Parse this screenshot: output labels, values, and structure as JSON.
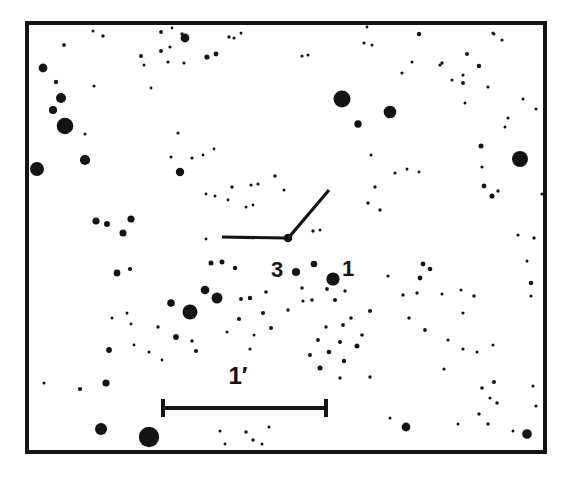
{
  "figure": {
    "kind": "astronomical-finding-chart",
    "title": "",
    "caption": "",
    "background_color": "#ffffff",
    "ink_color": "#141414",
    "frame": {
      "x": 27,
      "y": 23,
      "width": 518,
      "height": 429,
      "stroke_width": 4,
      "color": "#141414"
    }
  },
  "labels": {
    "comparison_star_3": "3",
    "comparison_star_1": "1",
    "scale_bar": "1′"
  },
  "chart_data": {
    "type": "scatter",
    "title": "",
    "subtitle": "",
    "xlabel": "",
    "ylabel": "",
    "grid": false,
    "legend": null,
    "xlim": [
      27,
      545
    ],
    "ylim": [
      23,
      452
    ],
    "axis_units": "image pixels (sky field, north/east orientation not marked)",
    "point_meaning": "Marker radius encodes stellar brightness: larger filled circle = brighter star.",
    "scale_bar": {
      "label": "1′",
      "length_arcmin": 1,
      "x_start": 163,
      "x_end": 326,
      "y": 408,
      "pixel_length": 163,
      "cap_half_height": 9,
      "line_width": 4,
      "label_x": 238,
      "label_y": 384
    },
    "target_marker": {
      "type": "two-stroke-tick",
      "target_x": 288,
      "target_y": 238,
      "strokes": [
        {
          "name": "horizontal-tick",
          "x1": 222,
          "y1": 237,
          "x2": 286,
          "y2": 238
        },
        {
          "name": "diagonal-tick",
          "x1": 290,
          "y1": 236,
          "x2": 329,
          "y2": 190
        }
      ],
      "line_width": 3.2
    },
    "annotations": [
      {
        "text": "3",
        "x": 277,
        "y": 277,
        "anchor": "middle",
        "font_size": 22,
        "bold": true,
        "refers_to_star": {
          "x": 296,
          "y": 272,
          "r": 4.0
        }
      },
      {
        "text": "1",
        "x": 348,
        "y": 276,
        "anchor": "middle",
        "font_size": 22,
        "bold": true,
        "refers_to_star": {
          "x": 333,
          "y": 279,
          "r": 6.6
        }
      },
      {
        "text": "1′",
        "x": 238,
        "y": 384,
        "anchor": "middle",
        "font_size": 24,
        "bold": true,
        "refers_to": "scale-bar"
      }
    ],
    "series": [
      {
        "name": "field stars",
        "marker": "filled-circle",
        "color": "#141414",
        "points": [
          [
            43,
            68,
            4.4
          ],
          [
            64,
            45,
            1.9
          ],
          [
            93,
            31,
            1.5
          ],
          [
            103,
            36,
            1.7
          ],
          [
            56,
            82,
            2.2
          ],
          [
            61,
            98,
            5.0
          ],
          [
            53,
            110,
            4.1
          ],
          [
            65,
            126,
            8.3
          ],
          [
            94,
            86,
            1.6
          ],
          [
            85,
            134,
            1.5
          ],
          [
            37,
            169,
            7.0
          ],
          [
            85,
            160,
            5.1
          ],
          [
            96,
            221,
            3.6
          ],
          [
            107,
            224,
            3.0
          ],
          [
            123,
            233,
            3.5
          ],
          [
            131,
            219,
            3.6
          ],
          [
            117,
            273,
            3.4
          ],
          [
            130,
            269,
            2.1
          ],
          [
            161,
            32,
            1.9
          ],
          [
            161,
            51,
            2.0
          ],
          [
            185,
            38,
            4.4
          ],
          [
            170,
            47,
            1.6
          ],
          [
            172,
            28,
            1.4
          ],
          [
            182,
            34,
            1.7
          ],
          [
            141,
            56,
            2.0
          ],
          [
            144,
            65,
            1.5
          ],
          [
            168,
            62,
            1.6
          ],
          [
            151,
            88,
            1.4
          ],
          [
            184,
            63,
            1.6
          ],
          [
            207,
            57,
            2.6
          ],
          [
            216,
            54,
            2.4
          ],
          [
            229,
            37,
            1.7
          ],
          [
            234,
            38,
            1.6
          ],
          [
            241,
            33,
            1.5
          ],
          [
            171,
            157,
            1.5
          ],
          [
            178,
            133,
            1.6
          ],
          [
            180,
            172,
            4.2
          ],
          [
            192,
            158,
            1.6
          ],
          [
            203,
            155,
            1.4
          ],
          [
            214,
            149,
            1.4
          ],
          [
            206,
            194,
            1.4
          ],
          [
            215,
            196,
            1.5
          ],
          [
            228,
            200,
            1.4
          ],
          [
            232,
            187,
            1.7
          ],
          [
            251,
            185,
            1.6
          ],
          [
            246,
            207,
            1.5
          ],
          [
            253,
            205,
            1.4
          ],
          [
            288,
            238,
            4.3
          ],
          [
            211,
            263,
            2.5
          ],
          [
            222,
            262,
            2.5
          ],
          [
            235,
            268,
            2.2
          ],
          [
            296,
            272,
            4.0
          ],
          [
            333,
            279,
            6.6
          ],
          [
            314,
            264,
            3.3
          ],
          [
            302,
            288,
            1.7
          ],
          [
            312,
            300,
            1.8
          ],
          [
            205,
            290,
            4.3
          ],
          [
            217,
            298,
            5.5
          ],
          [
            190,
            312,
            7.5
          ],
          [
            171,
            303,
            3.8
          ],
          [
            176,
            337,
            2.9
          ],
          [
            192,
            341,
            1.7
          ],
          [
            158,
            327,
            1.7
          ],
          [
            127,
            313,
            1.5
          ],
          [
            131,
            324,
            1.4
          ],
          [
            112,
            318,
            1.5
          ],
          [
            134,
            345,
            1.4
          ],
          [
            162,
            360,
            1.4
          ],
          [
            149,
            352,
            1.6
          ],
          [
            196,
            351,
            2.1
          ],
          [
            239,
            319,
            2.1
          ],
          [
            250,
            298,
            2.2
          ],
          [
            263,
            313,
            2.1
          ],
          [
            266,
            292,
            1.8
          ],
          [
            271,
            328,
            2.0
          ],
          [
            288,
            310,
            1.7
          ],
          [
            254,
            335,
            1.5
          ],
          [
            250,
            349,
            1.6
          ],
          [
            106,
            383,
            3.6
          ],
          [
            80,
            389,
            2.1
          ],
          [
            44,
            383,
            1.5
          ],
          [
            101,
            429,
            6.0
          ],
          [
            149,
            437,
            10.2
          ],
          [
            109,
            350,
            2.9
          ],
          [
            227,
            332,
            1.5
          ],
          [
            241,
            299,
            2.0
          ],
          [
            220,
            431,
            1.5
          ],
          [
            225,
            444,
            1.4
          ],
          [
            246,
            432,
            1.7
          ],
          [
            253,
            440,
            1.7
          ],
          [
            262,
            444,
            1.5
          ],
          [
            269,
            427,
            1.5
          ],
          [
            303,
            301,
            1.6
          ],
          [
            318,
            340,
            1.9
          ],
          [
            310,
            355,
            2.0
          ],
          [
            320,
            368,
            2.5
          ],
          [
            329,
            352,
            2.3
          ],
          [
            340,
            342,
            2.0
          ],
          [
            344,
            361,
            2.2
          ],
          [
            326,
            327,
            1.7
          ],
          [
            343,
            325,
            1.9
          ],
          [
            351,
            318,
            1.8
          ],
          [
            362,
            335,
            1.8
          ],
          [
            370,
            311,
            2.0
          ],
          [
            357,
            346,
            2.5
          ],
          [
            340,
            378,
            1.7
          ],
          [
            370,
            377,
            1.7
          ],
          [
            327,
            289,
            1.9
          ],
          [
            335,
            300,
            2.1
          ],
          [
            345,
            291,
            1.7
          ],
          [
            302,
            56,
            1.6
          ],
          [
            308,
            55,
            1.5
          ],
          [
            364,
            43,
            1.6
          ],
          [
            372,
            45,
            1.5
          ],
          [
            367,
            27,
            1.4
          ],
          [
            419,
            34,
            2.2
          ],
          [
            493,
            33,
            1.6
          ],
          [
            494,
            34,
            1.5
          ],
          [
            502,
            40,
            1.6
          ],
          [
            342,
            99,
            8.5
          ],
          [
            390,
            112,
            6.3
          ],
          [
            358,
            124,
            3.7
          ],
          [
            442,
            63,
            1.7
          ],
          [
            440,
            65,
            1.6
          ],
          [
            467,
            54,
            2.0
          ],
          [
            479,
            66,
            2.2
          ],
          [
            463,
            83,
            2.0
          ],
          [
            488,
            87,
            1.6
          ],
          [
            463,
            75,
            1.6
          ],
          [
            465,
            103,
            1.5
          ],
          [
            412,
            62,
            1.5
          ],
          [
            395,
            173,
            1.6
          ],
          [
            407,
            169,
            1.5
          ],
          [
            419,
            172,
            1.4
          ],
          [
            375,
            187,
            1.7
          ],
          [
            368,
            203,
            1.7
          ],
          [
            380,
            210,
            1.7
          ],
          [
            402,
            73,
            1.6
          ],
          [
            481,
            146,
            2.5
          ],
          [
            520,
            159,
            8.0
          ],
          [
            484,
            186,
            2.4
          ],
          [
            492,
            196,
            2.6
          ],
          [
            498,
            191,
            1.7
          ],
          [
            482,
            167,
            1.6
          ],
          [
            505,
            127,
            1.5
          ],
          [
            508,
            118,
            1.6
          ],
          [
            423,
            264,
            2.4
          ],
          [
            420,
            278,
            2.4
          ],
          [
            430,
            269,
            2.3
          ],
          [
            417,
            293,
            1.7
          ],
          [
            403,
            295,
            1.7
          ],
          [
            409,
            318,
            1.7
          ],
          [
            442,
            294,
            1.5
          ],
          [
            425,
            330,
            1.9
          ],
          [
            463,
            313,
            1.6
          ],
          [
            474,
            296,
            1.7
          ],
          [
            461,
            290,
            1.5
          ],
          [
            444,
            369,
            1.6
          ],
          [
            448,
            340,
            1.6
          ],
          [
            463,
            349,
            1.6
          ],
          [
            477,
            352,
            1.6
          ],
          [
            493,
            345,
            1.5
          ],
          [
            482,
            388,
            1.8
          ],
          [
            494,
            382,
            2.0
          ],
          [
            490,
            398,
            1.6
          ],
          [
            406,
            427,
            4.4
          ],
          [
            479,
            414,
            1.7
          ],
          [
            497,
            403,
            1.8
          ],
          [
            488,
            424,
            1.7
          ],
          [
            513,
            431,
            1.5
          ],
          [
            527,
            434,
            4.8
          ],
          [
            536,
            406,
            1.6
          ],
          [
            533,
            386,
            1.6
          ],
          [
            531,
            283,
            2.3
          ],
          [
            531,
            296,
            1.6
          ],
          [
            534,
            238,
            1.7
          ],
          [
            527,
            261,
            1.5
          ],
          [
            518,
            235,
            1.6
          ],
          [
            542,
            194,
            1.6
          ],
          [
            458,
            424,
            1.5
          ],
          [
            390,
            418,
            1.5
          ],
          [
            536,
            109,
            1.5
          ],
          [
            388,
            276,
            1.6
          ],
          [
            523,
            99,
            1.5
          ],
          [
            371,
            155,
            1.5
          ],
          [
            452,
            80,
            1.5
          ],
          [
            313,
            231,
            1.7
          ],
          [
            320,
            230,
            1.5
          ],
          [
            258,
            184,
            1.6
          ],
          [
            275,
            176,
            1.8
          ],
          [
            206,
            239,
            1.4
          ],
          [
            284,
            190,
            1.5
          ]
        ]
      }
    ]
  }
}
